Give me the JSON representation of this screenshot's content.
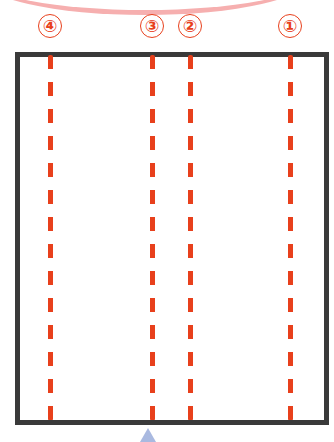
{
  "diagram": {
    "colors": {
      "border": "#3a3a3a",
      "cut_line": "#e8401c",
      "label": "#e8401c",
      "arrow": "#a9b9e0"
    },
    "lines": [
      {
        "label": "④",
        "x": 50
      },
      {
        "label": "③",
        "x": 152
      },
      {
        "label": "②",
        "x": 190
      },
      {
        "label": "①",
        "x": 290
      }
    ]
  }
}
